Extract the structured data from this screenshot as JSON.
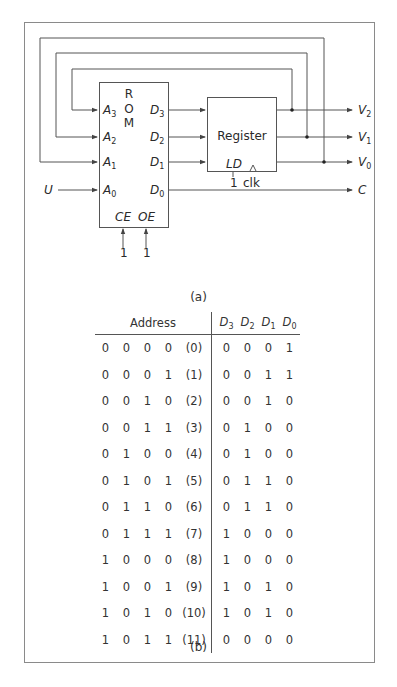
{
  "diagram_a": {
    "caption": "(a)",
    "rom": {
      "label_lines": [
        "R",
        "O",
        "M"
      ],
      "inputs": [
        {
          "name": "A",
          "sub": "3"
        },
        {
          "name": "A",
          "sub": "2"
        },
        {
          "name": "A",
          "sub": "1"
        },
        {
          "name": "A",
          "sub": "0"
        }
      ],
      "outputs": [
        {
          "name": "D",
          "sub": "3"
        },
        {
          "name": "D",
          "sub": "2"
        },
        {
          "name": "D",
          "sub": "1"
        },
        {
          "name": "D",
          "sub": "0"
        }
      ],
      "control_pins": [
        "CE",
        "OE"
      ],
      "control_values": [
        "1",
        "1"
      ]
    },
    "register": {
      "label": "Register",
      "load_pin": "LD",
      "load_value": "1",
      "clock_label": "clk"
    },
    "external_input": "U",
    "outputs": [
      {
        "name": "V",
        "sub": "2"
      },
      {
        "name": "V",
        "sub": "1"
      },
      {
        "name": "V",
        "sub": "0"
      },
      {
        "name": "C",
        "sub": ""
      }
    ]
  },
  "table_b": {
    "caption": "(b)",
    "header_address": "Address",
    "header_data": [
      {
        "name": "D",
        "sub": "3"
      },
      {
        "name": "D",
        "sub": "2"
      },
      {
        "name": "D",
        "sub": "1"
      },
      {
        "name": "D",
        "sub": "0"
      }
    ],
    "rows": [
      {
        "address": [
          "0",
          "0",
          "0",
          "0"
        ],
        "index": "(0)",
        "data": [
          "0",
          "0",
          "0",
          "1"
        ]
      },
      {
        "address": [
          "0",
          "0",
          "0",
          "1"
        ],
        "index": "(1)",
        "data": [
          "0",
          "0",
          "1",
          "1"
        ]
      },
      {
        "address": [
          "0",
          "0",
          "1",
          "0"
        ],
        "index": "(2)",
        "data": [
          "0",
          "0",
          "1",
          "0"
        ]
      },
      {
        "address": [
          "0",
          "0",
          "1",
          "1"
        ],
        "index": "(3)",
        "data": [
          "0",
          "1",
          "0",
          "0"
        ]
      },
      {
        "address": [
          "0",
          "1",
          "0",
          "0"
        ],
        "index": "(4)",
        "data": [
          "0",
          "1",
          "0",
          "0"
        ]
      },
      {
        "address": [
          "0",
          "1",
          "0",
          "1"
        ],
        "index": "(5)",
        "data": [
          "0",
          "1",
          "1",
          "0"
        ]
      },
      {
        "address": [
          "0",
          "1",
          "1",
          "0"
        ],
        "index": "(6)",
        "data": [
          "0",
          "1",
          "1",
          "0"
        ]
      },
      {
        "address": [
          "0",
          "1",
          "1",
          "1"
        ],
        "index": "(7)",
        "data": [
          "1",
          "0",
          "0",
          "0"
        ]
      },
      {
        "address": [
          "1",
          "0",
          "0",
          "0"
        ],
        "index": "(8)",
        "data": [
          "1",
          "0",
          "0",
          "0"
        ]
      },
      {
        "address": [
          "1",
          "0",
          "0",
          "1"
        ],
        "index": "(9)",
        "data": [
          "1",
          "0",
          "1",
          "0"
        ]
      },
      {
        "address": [
          "1",
          "0",
          "1",
          "0"
        ],
        "index": "(10)",
        "data": [
          "1",
          "0",
          "1",
          "0"
        ]
      },
      {
        "address": [
          "1",
          "0",
          "1",
          "1"
        ],
        "index": "(11)",
        "data": [
          "0",
          "0",
          "0",
          "0"
        ]
      }
    ]
  },
  "colors": {
    "frame": "#8a8a8a",
    "wire": "#555555",
    "text": "#2a2a2a"
  }
}
